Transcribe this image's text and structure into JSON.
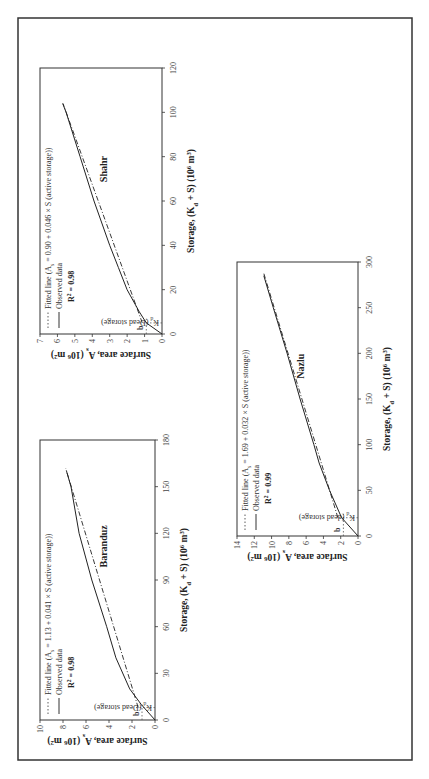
{
  "figure": {
    "orientation": "landscape page rotated 90° counter-clockwise",
    "border_color": "#333333"
  },
  "chart_data": [
    {
      "type": "line",
      "title": "Shahr",
      "xlabel": "Storage, (K_d + S) (10^6 m^3)",
      "ylabel": "Surface area, A_s (10^6 m^2)",
      "xlim": [
        0,
        120
      ],
      "ylim": [
        0,
        7
      ],
      "xticks": [
        "0",
        "20",
        "40",
        "60",
        "80",
        "100",
        "120"
      ],
      "yticks": [
        "0",
        "1",
        "2",
        "3",
        "4",
        "5",
        "6",
        "7"
      ],
      "grid": false,
      "legend_position": "upper left",
      "legend": [
        "Fitted line (A_s = 0.90 + 0.046 × S (active storage))",
        "Observed data"
      ],
      "r_squared": "R² = 0.98",
      "annotations": [
        "b",
        "K_d (Dead storage)"
      ],
      "intercept_b": 0.9,
      "dead_storage_kd": 5,
      "series": [
        {
          "name": "Observed data",
          "style": "solid",
          "x": [
            0,
            5,
            10,
            20,
            30,
            40,
            60,
            80,
            100,
            104
          ],
          "y": [
            0,
            0.9,
            1.3,
            2.0,
            2.5,
            3.0,
            3.9,
            4.7,
            5.5,
            5.7
          ]
        },
        {
          "name": "Fitted line",
          "style": "dash-dot",
          "x": [
            5,
            104
          ],
          "y": [
            1.13,
            5.68
          ]
        }
      ]
    },
    {
      "type": "line",
      "title": "Baranduz",
      "xlabel": "Storage, (K_d + S) (10^6 m^3)",
      "ylabel": "Surface area, A_s (10^6 m^2)",
      "xlim": [
        0,
        180
      ],
      "ylim": [
        0,
        10
      ],
      "xticks": [
        "0",
        "30",
        "60",
        "90",
        "120",
        "150",
        "180"
      ],
      "yticks": [
        "0",
        "2",
        "4",
        "6",
        "8",
        "10"
      ],
      "grid": false,
      "legend_position": "upper left",
      "legend": [
        "Fitted line (A_s = 1.13 + 0.041 × S (active storage))",
        "Observed data"
      ],
      "r_squared": "R² = 0.98",
      "annotations": [
        "b",
        "K_d (Dead storage)"
      ],
      "intercept_b": 1.13,
      "dead_storage_kd": 8,
      "series": [
        {
          "name": "Observed data",
          "style": "solid",
          "x": [
            0,
            10,
            20,
            40,
            60,
            90,
            120,
            150,
            160
          ],
          "y": [
            0,
            1.2,
            2.2,
            3.4,
            4.2,
            5.5,
            6.6,
            7.3,
            7.7
          ]
        },
        {
          "name": "Fitted line",
          "style": "dash-dot",
          "x": [
            8,
            162
          ],
          "y": [
            1.46,
            7.77
          ]
        }
      ]
    },
    {
      "type": "line",
      "title": "Nazlu",
      "xlabel": "Storage, (K_d + S) (10^6 m^3)",
      "ylabel": "Surface area, A_s (10^6 m^2)",
      "xlim": [
        0,
        300
      ],
      "ylim": [
        0,
        14
      ],
      "xticks": [
        "0",
        "50",
        "100",
        "150",
        "200",
        "250",
        "300"
      ],
      "yticks": [
        "0",
        "2",
        "4",
        "6",
        "8",
        "10",
        "12",
        "14"
      ],
      "grid": false,
      "legend_position": "upper left",
      "legend": [
        "Fitted line (A_s = 1.69 + 0.032 × S (active storage))",
        "Observed data"
      ],
      "r_squared": "R² = 0.99",
      "annotations": [
        "b",
        "K_d (dead storage)"
      ],
      "intercept_b": 1.69,
      "dead_storage_kd": 20,
      "series": [
        {
          "name": "Observed data",
          "style": "solid",
          "x": [
            0,
            20,
            50,
            80,
            100,
            150,
            200,
            250,
            285
          ],
          "y": [
            0,
            1.9,
            3.3,
            4.5,
            5.1,
            6.7,
            8.2,
            9.8,
            10.9
          ]
        },
        {
          "name": "Fitted line",
          "style": "dash-dot",
          "x": [
            20,
            288
          ],
          "y": [
            2.33,
            10.91
          ]
        }
      ]
    }
  ],
  "labels": {
    "shahr": {
      "name": "Shahr",
      "legend_fit": "Fitted line (A",
      "legend_fit_sub": "s",
      "legend_fit_rest": " = 0.90 + 0.046 × S (active storage))",
      "legend_obs": "Observed data",
      "r2": "R",
      "r2_rest": " = 0.98",
      "b": "b",
      "kd": "K",
      "kd_sub": "d",
      "kd_rest": " (Dead storage)",
      "xticks": [
        "0",
        "20",
        "40",
        "60",
        "80",
        "100",
        "120"
      ],
      "yticks": [
        "0",
        "1",
        "2",
        "3",
        "4",
        "5",
        "6",
        "7"
      ]
    },
    "baranduz": {
      "name": "Baranduz",
      "legend_fit": "Fitted line (A",
      "legend_fit_sub": "s",
      "legend_fit_rest": " = 1.13 + 0.041 × S (active storage))",
      "legend_obs": "Observed data",
      "r2": "R",
      "r2_rest": " = 0.98",
      "b": "b",
      "kd": "K",
      "kd_sub": "d",
      "kd_rest": " (Dead storage)",
      "xticks": [
        "0",
        "30",
        "60",
        "90",
        "120",
        "150",
        "180"
      ],
      "yticks": [
        "0",
        "2",
        "4",
        "6",
        "8",
        "10"
      ]
    },
    "nazlu": {
      "name": "Nazlu",
      "legend_fit": "Fitted line (A",
      "legend_fit_sub": "s",
      "legend_fit_rest": " = 1.69 + 0.032 × S (active storage))",
      "legend_obs": "Observed data",
      "r2": "R",
      "r2_rest": " = 0.99",
      "b": "b",
      "kd": "K",
      "kd_sub": "d",
      "kd_rest": " (dead storage)",
      "xticks": [
        "0",
        "50",
        "100",
        "150",
        "200",
        "250",
        "300"
      ],
      "yticks": [
        "0",
        "2",
        "4",
        "6",
        "8",
        "10",
        "12",
        "14"
      ]
    },
    "xlabel_main": "Storage, (K",
    "xlabel_sub": "d",
    "xlabel_rest": " + S) (10",
    "xlabel_sup": "6",
    "xlabel_end": " m",
    "xlabel_sup2": "3",
    "xlabel_close": ")",
    "ylabel_main": "Surface area, A",
    "ylabel_sub": "s",
    "ylabel_rest": " (10",
    "ylabel_sup": "6",
    "ylabel_end": " m",
    "ylabel_sup2": "2",
    "ylabel_close": ")"
  }
}
